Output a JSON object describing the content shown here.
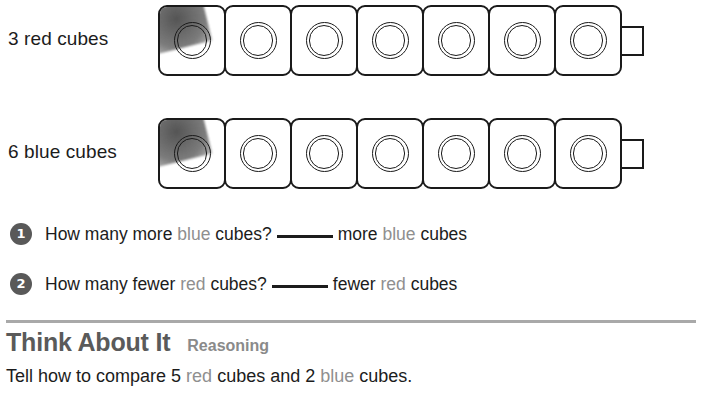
{
  "worksheet": {
    "rows": [
      {
        "label": "3 red cubes",
        "cube_count": 7,
        "has_connector": true,
        "name": "red-cube-train"
      },
      {
        "label": "6 blue cubes",
        "cube_count": 7,
        "has_connector": true,
        "name": "blue-cube-train"
      }
    ],
    "questions": [
      {
        "number": "1",
        "part1": "How many more",
        "tint1": "blue",
        "part2": "cubes?",
        "blank": "",
        "part3": "more",
        "tint2": "blue",
        "part4": "cubes"
      },
      {
        "number": "2",
        "part1": "How many fewer",
        "tint1": "red",
        "part2": "cubes?",
        "blank": "",
        "part3": "fewer",
        "tint2": "red",
        "part4": "cubes"
      }
    ],
    "think_about_it": {
      "title": "Think About It",
      "subtitle": "Reasoning",
      "body_part1": "Tell how to compare 5",
      "body_tint1": "red",
      "body_part2": "cubes and 2",
      "body_tint2": "blue",
      "body_part3": "cubes."
    },
    "colors": {
      "ink": "#1c1c1c",
      "tint": "#8f8f8f",
      "badge": "#595959",
      "heading": "#5a5a5a",
      "subheading": "#8a8a8a",
      "divider": "#9a9a9a"
    }
  }
}
